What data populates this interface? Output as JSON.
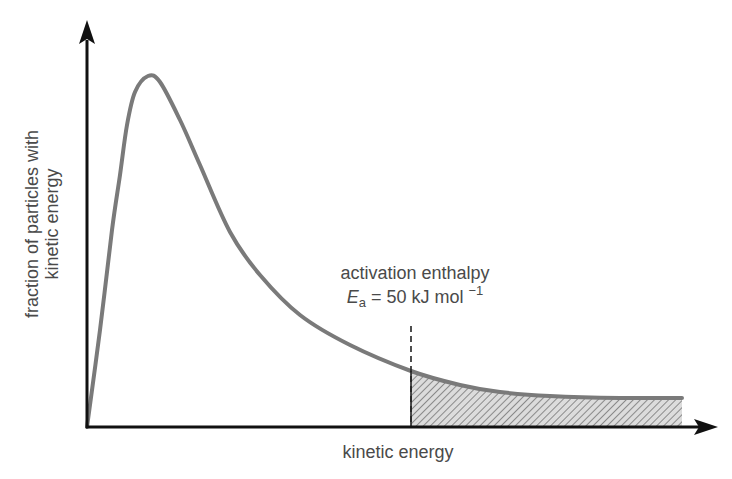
{
  "chart_data": {
    "type": "line",
    "title": "",
    "xlabel": "kinetic energy",
    "ylabel_lines": [
      "fraction of particles with",
      "kinetic energy"
    ],
    "ylabel": "fraction of particles with kinetic energy",
    "grid": false,
    "ticks": false,
    "legend": null,
    "series": [
      {
        "name": "distribution curve",
        "color": "#7a7a7a",
        "points_px": [
          [
            87,
            427
          ],
          [
            100,
            330
          ],
          [
            112,
            230
          ],
          [
            120,
            175
          ],
          [
            127,
            125
          ],
          [
            135,
            92
          ],
          [
            148,
            76
          ],
          [
            160,
            82
          ],
          [
            180,
            120
          ],
          [
            200,
            165
          ],
          [
            230,
            232
          ],
          [
            260,
            275
          ],
          [
            300,
            315
          ],
          [
            350,
            345
          ],
          [
            411,
            371
          ],
          [
            460,
            385
          ],
          [
            500,
            392
          ],
          [
            550,
            396
          ],
          [
            620,
            398
          ],
          [
            682,
            398
          ]
        ]
      }
    ],
    "annotation": {
      "line1": "activation enthalpy",
      "symbol": "E",
      "subscript": "a",
      "equals_text": " = 50 kJ mol ",
      "superscript": "−1",
      "full_text": "activation enthalpy Ea = 50 kJ mol−1",
      "marker_x_px": 411
    },
    "shaded_region": {
      "from_x_px": 411,
      "to_x_px": 682,
      "pattern": "diagonal hatch",
      "meaning": "particles with energy ≥ Ea"
    },
    "colors": {
      "axis": "#111111",
      "curve": "#7a7a7a",
      "text": "#4a4a4a",
      "hatch_bg": "#d9d9d9",
      "hatch_line": "#8a8a8a"
    }
  }
}
